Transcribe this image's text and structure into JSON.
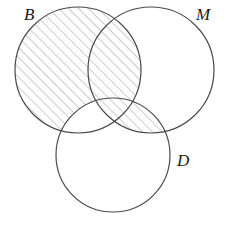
{
  "figure": {
    "kind": "venn-diagram",
    "set_count": 3,
    "background_color": "#ffffff",
    "stroke_color": "#4a4a4a",
    "hatch_color": "#9a9a9a",
    "hatch_angle_degrees": 45,
    "hatch_spacing_px": 7,
    "width": 227,
    "height": 230
  },
  "sets": [
    {
      "id": "B",
      "label": "B",
      "cx": 78,
      "cy": 70,
      "r": 63,
      "label_x": 24,
      "label_y": 6
    },
    {
      "id": "M",
      "label": "M",
      "cx": 151,
      "cy": 70,
      "r": 63,
      "label_x": 196,
      "label_y": 6
    },
    {
      "id": "D",
      "label": "D",
      "cx": 113,
      "cy": 155,
      "r": 57,
      "label_x": 177,
      "label_y": 152
    }
  ],
  "regions": [
    {
      "id": "B-only",
      "name": "B only",
      "shaded": true
    },
    {
      "id": "M-only",
      "name": "M only",
      "shaded": false
    },
    {
      "id": "D-only",
      "name": "D only",
      "shaded": false
    },
    {
      "id": "BM",
      "name": "B and M not D",
      "shaded": true
    },
    {
      "id": "BD",
      "name": "B and D not M",
      "shaded": false
    },
    {
      "id": "MD",
      "name": "M and D not B",
      "shaded": true
    },
    {
      "id": "BMD",
      "name": "B and M and D",
      "shaded": true
    }
  ]
}
